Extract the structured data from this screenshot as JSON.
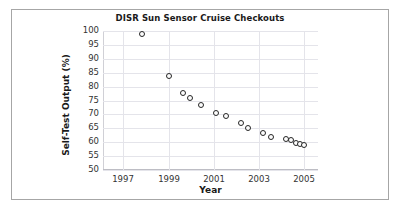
{
  "figure": {
    "border_color": "#a6a6a6",
    "background": "#ffffff"
  },
  "chart_data": {
    "type": "scatter",
    "title": "DISR Sun Sensor Cruise Checkouts",
    "xlabel": "Year",
    "ylabel": "Self-Test Output (%)",
    "xlim": [
      1996.1,
      2005.6
    ],
    "ylim": [
      50,
      100
    ],
    "grid": true,
    "legend": false,
    "marker": "open-circle",
    "marker_edge_color": "#262626",
    "marker_face_color": "#fdfdfd",
    "xticks": [
      1997,
      1999,
      2001,
      2003,
      2005
    ],
    "xtick_labels": [
      "1997",
      "1999",
      "2001",
      "2003",
      "2005"
    ],
    "yticks": [
      50,
      55,
      60,
      65,
      70,
      75,
      80,
      85,
      90,
      95,
      100
    ],
    "ytick_labels": [
      "50",
      "55",
      "60",
      "65",
      "70",
      "75",
      "80",
      "85",
      "90",
      "95",
      "100"
    ],
    "series": [
      {
        "name": "Self-Test Output",
        "points": [
          {
            "x": 1997.8,
            "y": 98.8
          },
          {
            "x": 1999.02,
            "y": 84.0
          },
          {
            "x": 1999.62,
            "y": 77.8
          },
          {
            "x": 1999.92,
            "y": 76.0
          },
          {
            "x": 2000.42,
            "y": 73.4
          },
          {
            "x": 2001.1,
            "y": 70.7
          },
          {
            "x": 2001.52,
            "y": 69.3
          },
          {
            "x": 2002.18,
            "y": 67.0
          },
          {
            "x": 2002.52,
            "y": 65.2
          },
          {
            "x": 2003.18,
            "y": 63.4
          },
          {
            "x": 2003.5,
            "y": 62.0
          },
          {
            "x": 2004.18,
            "y": 61.0
          },
          {
            "x": 2004.4,
            "y": 60.7
          },
          {
            "x": 2004.62,
            "y": 59.8
          },
          {
            "x": 2004.8,
            "y": 59.3
          },
          {
            "x": 2004.98,
            "y": 59.0
          }
        ]
      }
    ]
  }
}
